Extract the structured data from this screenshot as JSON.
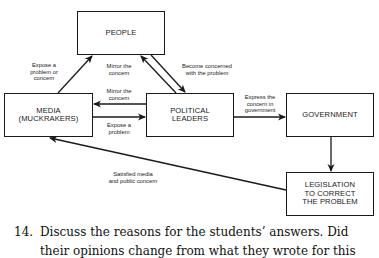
{
  "diagram": {
    "nodes": {
      "people": "PEOPLE",
      "media": "MEDIA\n(MUCKRAKERS)",
      "political_leaders": "POLITICAL\nLEADERS",
      "government": "GOVERNMENT",
      "legislation": "LEGISLATION\nTO CORRECT\nTHE PROBLEM"
    },
    "edges": {
      "media_to_people": "Expose a\nproblem or\nconcern",
      "leaders_to_people": "Mirror the\nconcern",
      "people_to_leaders": "Become concerned\nwith the problem",
      "leaders_to_media": "Mirror the\nconcern",
      "media_to_leaders": "Expose a\nproblem",
      "leaders_to_government": "Express the\nconcern in\ngovernment",
      "legislation_to_media": "Satisfied media\nand public concern"
    }
  },
  "question": {
    "number": "14.",
    "line1": "Discuss the reasons for the students’ answers. Did",
    "line2": "their opinions change from what they wrote for this"
  }
}
